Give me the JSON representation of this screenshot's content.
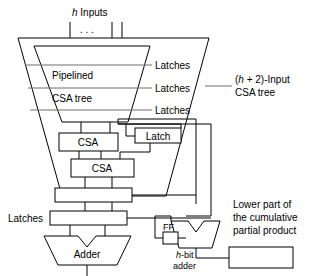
{
  "diagram": {
    "colors": {
      "stroke": "#000000",
      "gray_stroke": "#6e6e6e",
      "fill": "#ffffff",
      "background": "#ffffff"
    },
    "top": {
      "inputs_label": "h Inputs",
      "inputs_label_italic_part": "h",
      "inputs_label_rest": " Inputs",
      "ellipsis": ". . ."
    },
    "tree": {
      "line1": "Pipelined",
      "line2": "CSA tree"
    },
    "latch_labels": [
      "Latches",
      "Latches",
      "Latches"
    ],
    "side_note": {
      "line1": "(h + 2)-Input",
      "line1_prefix": "(",
      "line1_italic": "h",
      "line1_suffix": " + 2)-Input",
      "line2": "CSA tree"
    },
    "blocks": {
      "csa_upper": "CSA",
      "csa_lower": "CSA",
      "latch_box": "Latch",
      "adder": "Adder",
      "ff": "FF"
    },
    "latches_left_label": "Latches",
    "small_adder": {
      "line1": "h-bit",
      "line1_italic": "h",
      "line1_suffix": "-bit",
      "line2": "adder"
    },
    "lower_note": {
      "line1": "Lower part of",
      "line2": "the cumulative",
      "line3": "partial product"
    }
  }
}
